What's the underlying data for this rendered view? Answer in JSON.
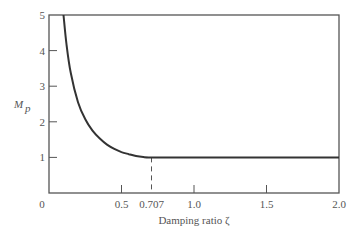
{
  "chart_data": {
    "type": "line",
    "title": "",
    "xlabel": "Damping ratio ζ",
    "ylabel": "M_p",
    "xlim": [
      0,
      2.0
    ],
    "ylim": [
      0,
      5
    ],
    "grid": false,
    "legend": null,
    "x_ticks": [
      {
        "value": 0,
        "label": "0"
      },
      {
        "value": 0.5,
        "label": "0.5"
      },
      {
        "value": 0.707,
        "label": "0.707"
      },
      {
        "value": 1.0,
        "label": "1.0"
      },
      {
        "value": 1.5,
        "label": "1.5"
      },
      {
        "value": 2.0,
        "label": "2.0"
      }
    ],
    "y_ticks": [
      {
        "value": 1,
        "label": "1"
      },
      {
        "value": 2,
        "label": "2"
      },
      {
        "value": 3,
        "label": "3"
      },
      {
        "value": 4,
        "label": "4"
      },
      {
        "value": 5,
        "label": "5"
      }
    ],
    "series": [
      {
        "name": "M_p",
        "description": "Resonant peak Mp = 1/(2ζ√(1-ζ²)) for ζ < 0.707, Mp = 1 for ζ ≥ 0.707",
        "x": [
          0.1,
          0.12,
          0.15,
          0.2,
          0.25,
          0.3,
          0.35,
          0.4,
          0.45,
          0.5,
          0.55,
          0.6,
          0.65,
          0.707,
          1.0,
          1.5,
          2.0
        ],
        "y": [
          5.03,
          4.2,
          3.37,
          2.55,
          2.07,
          1.75,
          1.53,
          1.36,
          1.24,
          1.15,
          1.09,
          1.04,
          1.01,
          1.0,
          1.0,
          1.0,
          1.0
        ]
      }
    ],
    "annotations": [
      {
        "type": "dashed-vertical-line",
        "x": 0.707,
        "y_from": 0,
        "y_to": 1.0
      }
    ]
  }
}
